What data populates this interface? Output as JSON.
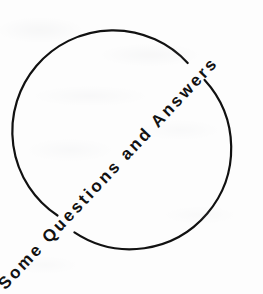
{
  "figure": {
    "title_text": "Some Questions and Answers",
    "words": [
      "Some",
      "Questions",
      "and",
      "Answers"
    ],
    "ink_color": "#111111",
    "background_color": "#fdfdfd",
    "canvas": {
      "width": 263,
      "height": 294
    }
  },
  "shapes": {
    "circle": {
      "name": "open circle outline",
      "center_x": 131,
      "center_y": 147,
      "radius": 101,
      "stroke_width": 2.2,
      "stroke_color": "#111111",
      "fill": "none",
      "gap_lower_left_deg": 225,
      "gap_upper_right_deg": 45,
      "gap_span_deg": 16
    },
    "text_path": {
      "name": "diagonal baseline",
      "angle_deg": -45,
      "start_x": 8,
      "start_y": 288,
      "end_x": 258,
      "end_y": 22,
      "letter_spacing": 2.6,
      "font_size": 17,
      "font_weight": 600
    }
  },
  "accessibility": {
    "figure_role": "decorative heading graphic",
    "reading_order": "bottom-left to top-right"
  }
}
